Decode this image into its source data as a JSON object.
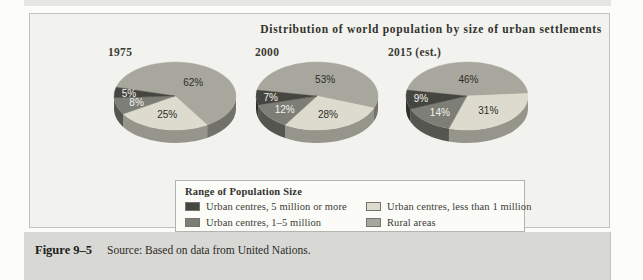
{
  "figure": {
    "label": "Figure 9–5",
    "source": "Source: Based on data from United Nations."
  },
  "chart_data": {
    "type": "pie",
    "title": "Distribution of world population by size of urban settlements",
    "legend_title": "Range of Population Size",
    "unit": "percent",
    "categories": [
      "Urban centres, 5 million or more",
      "Urban centres, 1–5 million",
      "Urban centres, less than 1 million",
      "Rural areas"
    ],
    "colors": [
      "#45463f",
      "#7d7e75",
      "#dcdbcd",
      "#a7a79d"
    ],
    "charts": [
      {
        "label": "1975",
        "values": [
          5,
          8,
          25,
          62
        ]
      },
      {
        "label": "2000",
        "values": [
          7,
          12,
          28,
          53
        ]
      },
      {
        "label": "2015 (est.)",
        "values": [
          9,
          14,
          31,
          46
        ]
      }
    ],
    "source": "Based on data from United Nations"
  }
}
